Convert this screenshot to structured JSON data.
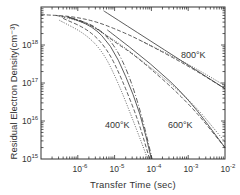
{
  "chart_data": {
    "type": "line",
    "title": "",
    "xlabel": "Transfer  Time (sec)",
    "ylabel": "Residual Electron Density(cm⁻³)",
    "xscale": "log",
    "yscale": "log",
    "xlim": [
      1e-07,
      0.01
    ],
    "ylim": [
      1000000000000000.0,
      1e+19
    ],
    "grid": false,
    "legend": "none",
    "x_ticks": [
      {
        "base": "10",
        "exp": "-6",
        "value": 1e-06
      },
      {
        "base": "10",
        "exp": "-5",
        "value": 1e-05
      },
      {
        "base": "10",
        "exp": "-4",
        "value": 0.0001
      },
      {
        "base": "10",
        "exp": "-3",
        "value": 0.001
      },
      {
        "base": "10",
        "exp": "-2",
        "value": 0.01
      }
    ],
    "y_ticks": [
      {
        "base": "10",
        "exp": "15",
        "value": 1000000000000000.0
      },
      {
        "base": "10",
        "exp": "16",
        "value": 1e+16
      },
      {
        "base": "10",
        "exp": "17",
        "value": 1e+17
      },
      {
        "base": "10",
        "exp": "18",
        "value": 1e+18
      }
    ],
    "annotations": [
      {
        "text": "800°K",
        "x": 0.0003,
        "y": 1.5e+17
      },
      {
        "text": "600°K",
        "x": 0.00025,
        "y": 6000000000000000.0
      },
      {
        "text": "400°K",
        "x": 1.5e-05,
        "y": 6000000000000000.0
      }
    ],
    "series": [
      {
        "name": "800K asymptote",
        "style": "solid",
        "log_points": [
          [
            -5.3,
            18.9
          ],
          [
            -2,
            16.85
          ]
        ]
      },
      {
        "name": "800K curve (dashed)",
        "style": "dashed",
        "log_points": [
          [
            -7,
            18.8
          ],
          [
            -6.2,
            18.76
          ],
          [
            -5.5,
            18.62
          ],
          [
            -4.8,
            18.35
          ],
          [
            -4.25,
            18.1
          ],
          [
            -3,
            17.45
          ],
          [
            -2,
            16.85
          ]
        ]
      },
      {
        "name": "800K curve (dotted)",
        "style": "dotted",
        "log_points": [
          [
            -4.3,
            18.12
          ],
          [
            -3,
            17.5
          ],
          [
            -2,
            16.93
          ]
        ]
      },
      {
        "name": "600K asymptote",
        "style": "solid",
        "log_points": [
          [
            -5.2,
            18.4
          ],
          [
            -4,
            17.5
          ],
          [
            -3,
            16.6
          ],
          [
            -2,
            15.3
          ]
        ]
      },
      {
        "name": "600K curve (dashed)",
        "style": "dashed",
        "log_points": [
          [
            -6.6,
            18.78
          ],
          [
            -6,
            18.68
          ],
          [
            -5.5,
            18.45
          ],
          [
            -5,
            18.08
          ],
          [
            -4.4,
            17.7
          ],
          [
            -3,
            16.5
          ],
          [
            -2,
            15.3
          ]
        ]
      },
      {
        "name": "600K curve (dotted)",
        "style": "dotted",
        "log_points": [
          [
            -6.5,
            18.75
          ],
          [
            -5.8,
            18.6
          ],
          [
            -5.2,
            18.25
          ],
          [
            -4.6,
            17.85
          ],
          [
            -3,
            16.62
          ],
          [
            -2,
            15.45
          ]
        ]
      },
      {
        "name": "400K curve (solid)",
        "style": "solid",
        "log_points": [
          [
            -6.3,
            18.75
          ],
          [
            -5.6,
            18.5
          ],
          [
            -5.1,
            18.0
          ],
          [
            -4.7,
            17.2
          ],
          [
            -4.3,
            16.2
          ],
          [
            -4.0,
            15.0
          ]
        ]
      },
      {
        "name": "400K curve (dashed)",
        "style": "dashed",
        "log_points": [
          [
            -6.4,
            18.7
          ],
          [
            -5.7,
            18.4
          ],
          [
            -5.2,
            17.9
          ],
          [
            -4.8,
            17.1
          ],
          [
            -4.35,
            16.0
          ],
          [
            -4.05,
            15.0
          ]
        ]
      },
      {
        "name": "400K curve (dotted)",
        "style": "dotted",
        "log_points": [
          [
            -6.5,
            18.65
          ],
          [
            -5.8,
            18.3
          ],
          [
            -5.3,
            17.8
          ],
          [
            -4.9,
            17.0
          ],
          [
            -4.45,
            15.9
          ],
          [
            -4.1,
            15.0
          ]
        ]
      },
      {
        "name": "400K curve (dash-dot)",
        "style": "dashdot",
        "log_points": [
          [
            -6.2,
            18.72
          ],
          [
            -5.5,
            18.5
          ],
          [
            -5.0,
            18.0
          ],
          [
            -4.6,
            17.2
          ],
          [
            -4.25,
            16.1
          ],
          [
            -3.98,
            15.0
          ]
        ]
      }
    ]
  },
  "labels": {
    "ylabel": "Residual Electron Density(cm⁻³)",
    "xlabel": "Transfer  Time (sec)",
    "ann_800": "800°K",
    "ann_600": "600°K",
    "ann_400": "400°K",
    "ten": "10",
    "y18": "18",
    "y17": "17",
    "y16": "16",
    "y15": "15",
    "xm6": "-6",
    "xm5": "-5",
    "xm4": "-4",
    "xm3": "-3",
    "xm2": "-2"
  }
}
